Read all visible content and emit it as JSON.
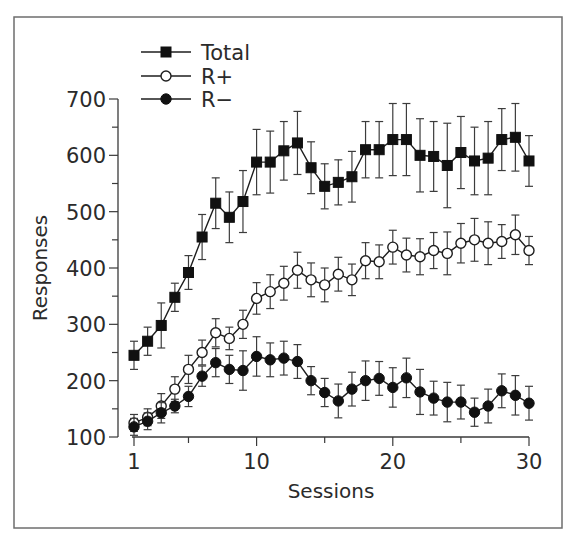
{
  "chart_data": {
    "type": "line",
    "title": "",
    "xlabel": "Sessions",
    "ylabel": "Responses",
    "xlim": [
      1,
      30
    ],
    "ylim": [
      100,
      700
    ],
    "x_ticks": [
      1,
      10,
      20,
      30
    ],
    "x_minor_ticks": [
      5,
      15,
      25
    ],
    "y_ticks": [
      100,
      200,
      300,
      400,
      500,
      600,
      700
    ],
    "y_minor_ticks": [
      150,
      250,
      350,
      450,
      550,
      650
    ],
    "grid": false,
    "legend_position": "top-left",
    "x": [
      1,
      2,
      3,
      4,
      5,
      6,
      7,
      8,
      9,
      10,
      11,
      12,
      13,
      14,
      15,
      16,
      17,
      18,
      19,
      20,
      21,
      22,
      23,
      24,
      25,
      26,
      27,
      28,
      29,
      30
    ],
    "series": [
      {
        "name": "Total",
        "marker": "filled-square",
        "values": [
          245,
          270,
          298,
          348,
          392,
          455,
          515,
          490,
          518,
          588,
          588,
          608,
          622,
          578,
          545,
          552,
          562,
          610,
          610,
          628,
          628,
          600,
          598,
          582,
          605,
          590,
          595,
          628,
          632,
          590
        ],
        "errors": [
          25,
          25,
          40,
          25,
          30,
          40,
          45,
          45,
          55,
          58,
          55,
          52,
          56,
          46,
          40,
          40,
          45,
          50,
          50,
          64,
          64,
          65,
          62,
          75,
          64,
          60,
          65,
          55,
          60,
          45
        ]
      },
      {
        "name": "R+",
        "marker": "open-circle",
        "values": [
          125,
          135,
          155,
          185,
          220,
          250,
          285,
          275,
          300,
          346,
          358,
          373,
          396,
          379,
          370,
          389,
          379,
          413,
          411,
          437,
          423,
          420,
          431,
          426,
          444,
          450,
          444,
          447,
          459,
          431
        ],
        "errors": [
          15,
          15,
          22,
          22,
          25,
          22,
          25,
          20,
          25,
          28,
          30,
          30,
          32,
          30,
          30,
          30,
          28,
          32,
          30,
          30,
          30,
          32,
          32,
          38,
          35,
          38,
          38,
          30,
          35,
          25
        ]
      },
      {
        "name": "R−",
        "marker": "filled-circle",
        "values": [
          118,
          128,
          143,
          155,
          172,
          208,
          232,
          220,
          218,
          243,
          237,
          240,
          234,
          200,
          179,
          164,
          185,
          200,
          204,
          188,
          205,
          180,
          169,
          162,
          162,
          144,
          155,
          182,
          174,
          160
        ],
        "errors": [
          15,
          15,
          18,
          12,
          18,
          18,
          25,
          25,
          35,
          35,
          30,
          30,
          30,
          25,
          25,
          30,
          30,
          35,
          30,
          35,
          35,
          40,
          30,
          35,
          30,
          25,
          30,
          30,
          35,
          30
        ]
      }
    ]
  }
}
